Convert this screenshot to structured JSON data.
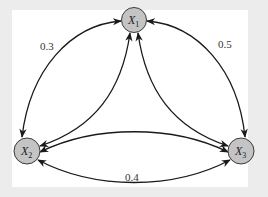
{
  "diagram": {
    "type": "markov-chain",
    "colors": {
      "background": "#ececec",
      "panel": "#ffffff",
      "node_fill": "#c4c4c4",
      "edge": "#1a1a1a"
    },
    "nodes": [
      {
        "id": "X1",
        "label": "X",
        "subscript": "1",
        "cx": 134,
        "cy": 20
      },
      {
        "id": "X2",
        "label": "X",
        "subscript": "2",
        "cx": 27,
        "cy": 151
      },
      {
        "id": "X3",
        "label": "X",
        "subscript": "3",
        "cx": 241,
        "cy": 151
      }
    ],
    "edges": [
      {
        "from": "X1",
        "to": "X2",
        "label": "0.3",
        "style": "outer-curve",
        "direction": "both"
      },
      {
        "from": "X1",
        "to": "X3",
        "label": "0.5",
        "style": "outer-curve",
        "direction": "both"
      },
      {
        "from": "X2",
        "to": "X3",
        "label": "0.4",
        "style": "outer-curve",
        "direction": "both"
      },
      {
        "from": "X1",
        "to": "X2",
        "label": "",
        "style": "inner-curve",
        "direction": "both"
      },
      {
        "from": "X1",
        "to": "X3",
        "label": "",
        "style": "inner-curve",
        "direction": "both"
      },
      {
        "from": "X2",
        "to": "X3",
        "label": "",
        "style": "inner-curve",
        "direction": "both"
      }
    ],
    "edge_labels": {
      "x1_x2": "0.3",
      "x1_x3": "0.5",
      "x2_x3": "0.4"
    }
  }
}
